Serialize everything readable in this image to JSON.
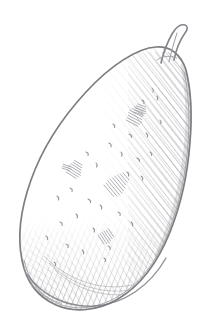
{
  "artwork": {
    "title": "Pear",
    "subject": "pear",
    "medium": "graphite pencil sketch",
    "style": "hand-drawn hatching and stippling",
    "background_color": "#ffffff",
    "canvas": {
      "width": 210,
      "height": 330
    },
    "alt_text": "A hand-drawn graphite pencil sketch of a pear with a short curved stem, shaded with diagonal hatching along the right side and dense cross-hatching across the bottom."
  },
  "palette": {
    "paper": "#ffffff",
    "outline": "#7d7d82",
    "outline_soft": "#9a9a9f",
    "hatch_light": "#b8b8bd",
    "hatch_mid": "#9b9ba1",
    "hatch_dark": "#7a7a80",
    "speckle": "#8d8d93",
    "stem": "#83838a"
  },
  "parts": [
    {
      "id": "body",
      "label": "Pear body outline"
    },
    {
      "id": "stem",
      "label": "Pear stem"
    },
    {
      "id": "right-shading",
      "label": "Right side diagonal hatching"
    },
    {
      "id": "bottom-shading",
      "label": "Bottom cross-hatching"
    },
    {
      "id": "left-shading",
      "label": "Lower left hatching"
    },
    {
      "id": "skin-speckles",
      "label": "Skin speckle texture marks"
    },
    {
      "id": "interior-hatch-patches",
      "label": "Interior hatch texture patches"
    }
  ],
  "geometry": {
    "body_path": "M 186 70 C 191 90 192 118 190 142 C 188 170 182 202 170 232 C 158 262 140 286 118 299 C 98 311 74 313 56 305 C 38 297 26 281 22 260 C 17 236 21 208 31 180 C 42 149 62 118 86 92 C 110 66 137 48 156 47 C 170 46 181 54 186 70 Z",
    "stem_path": "M 161 63 C 163 54 167 43 172 34 C 176 27 181 24 185 25 C 188 26 188 29 185 33 C 180 40 176 50 174 60",
    "stem_inner": "M 177 33 C 174 42 171 53 169 62",
    "bounds": {
      "left": 20,
      "top": 25,
      "right": 192,
      "bottom": 313
    }
  },
  "shading": {
    "right_hatch_angle_deg": -38,
    "bottom_hatch_angle_deg": 22,
    "left_hatch_angle_deg": -55,
    "density": "medium-to-dense toward lower right",
    "highlight_region": "upper left of body (left clear of marks)"
  }
}
